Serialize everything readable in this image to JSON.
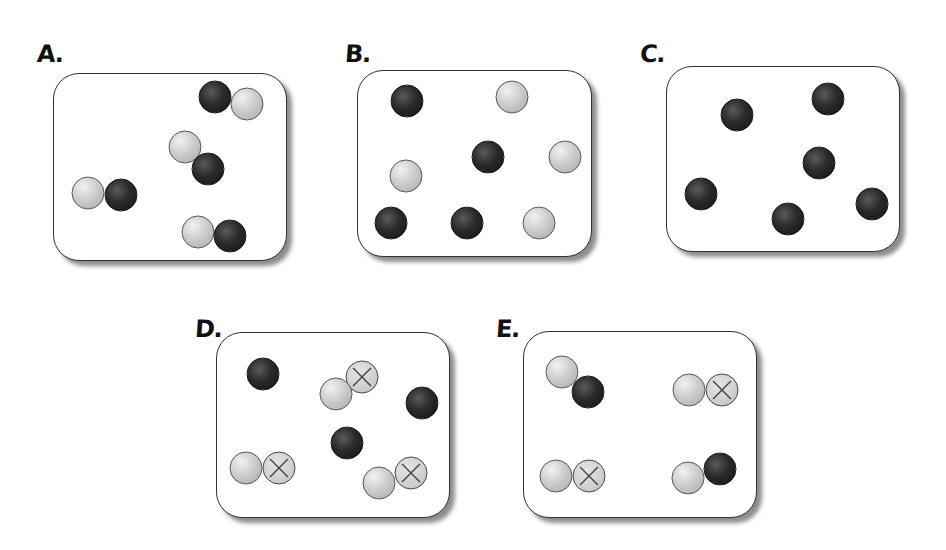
{
  "figure": {
    "panels": [
      {
        "id": "A",
        "label": "A.",
        "label_pos": [
          37,
          40
        ],
        "box": [
          53,
          73,
          234,
          188
        ],
        "description": "Four diatomic molecules, each one light atom bonded to one dark atom",
        "atoms": [
          {
            "type": "dark",
            "x": 215,
            "y": 97
          },
          {
            "type": "light",
            "x": 247,
            "y": 104
          },
          {
            "type": "light",
            "x": 185,
            "y": 147
          },
          {
            "type": "dark",
            "x": 208,
            "y": 169
          },
          {
            "type": "light",
            "x": 88,
            "y": 193
          },
          {
            "type": "dark",
            "x": 121,
            "y": 195
          },
          {
            "type": "light",
            "x": 198,
            "y": 232
          },
          {
            "type": "dark",
            "x": 230,
            "y": 236
          }
        ]
      },
      {
        "id": "B",
        "label": "B.",
        "label_pos": [
          345,
          40
        ],
        "box": [
          357,
          70,
          235,
          187
        ],
        "description": "Eight separate atoms: four dark, four light",
        "atoms": [
          {
            "type": "dark",
            "x": 407,
            "y": 101
          },
          {
            "type": "light",
            "x": 512,
            "y": 97
          },
          {
            "type": "dark",
            "x": 488,
            "y": 157
          },
          {
            "type": "light",
            "x": 565,
            "y": 157
          },
          {
            "type": "light",
            "x": 406,
            "y": 176
          },
          {
            "type": "dark",
            "x": 391,
            "y": 223
          },
          {
            "type": "dark",
            "x": 467,
            "y": 223
          },
          {
            "type": "light",
            "x": 539,
            "y": 223
          }
        ]
      },
      {
        "id": "C",
        "label": "C.",
        "label_pos": [
          640,
          40
        ],
        "box": [
          666,
          66,
          234,
          186
        ],
        "description": "Six separate dark atoms",
        "atoms": [
          {
            "type": "dark",
            "x": 737,
            "y": 115
          },
          {
            "type": "dark",
            "x": 828,
            "y": 99
          },
          {
            "type": "dark",
            "x": 819,
            "y": 163
          },
          {
            "type": "dark",
            "x": 701,
            "y": 194
          },
          {
            "type": "dark",
            "x": 788,
            "y": 219
          },
          {
            "type": "dark",
            "x": 872,
            "y": 204
          }
        ]
      },
      {
        "id": "D",
        "label": "D.",
        "label_pos": [
          195,
          315
        ],
        "box": [
          216,
          332,
          234,
          186
        ],
        "description": "Three separate dark atoms and three light-crossed diatomic molecules",
        "atoms": [
          {
            "type": "dark",
            "x": 263,
            "y": 374
          },
          {
            "type": "crossed",
            "x": 362,
            "y": 377
          },
          {
            "type": "light",
            "x": 336,
            "y": 394
          },
          {
            "type": "dark",
            "x": 422,
            "y": 403
          },
          {
            "type": "dark",
            "x": 347,
            "y": 443
          },
          {
            "type": "light",
            "x": 246,
            "y": 468
          },
          {
            "type": "crossed",
            "x": 279,
            "y": 468
          },
          {
            "type": "crossed",
            "x": 411,
            "y": 473
          },
          {
            "type": "light",
            "x": 379,
            "y": 483
          }
        ]
      },
      {
        "id": "E",
        "label": "E.",
        "label_pos": [
          496,
          315
        ],
        "box": [
          523,
          331,
          234,
          187
        ],
        "description": "Two light-dark molecules and two light-crossed molecules",
        "atoms": [
          {
            "type": "light",
            "x": 562,
            "y": 372
          },
          {
            "type": "dark",
            "x": 588,
            "y": 392
          },
          {
            "type": "light",
            "x": 689,
            "y": 390
          },
          {
            "type": "crossed",
            "x": 722,
            "y": 390
          },
          {
            "type": "light",
            "x": 556,
            "y": 476
          },
          {
            "type": "crossed",
            "x": 589,
            "y": 476
          },
          {
            "type": "dark",
            "x": 720,
            "y": 469
          },
          {
            "type": "light",
            "x": 688,
            "y": 478
          }
        ]
      }
    ],
    "legend_icons": {
      "dark": "dark-atom-icon",
      "light": "light-atom-icon",
      "crossed": "crossed-atom-icon"
    },
    "colors": {
      "dark_atom": "#1e1e1e",
      "light_atom": "#c8c8c8",
      "crossed_atom": "#cfcfcf",
      "box_border": "#333333",
      "background": "#ffffff"
    }
  }
}
